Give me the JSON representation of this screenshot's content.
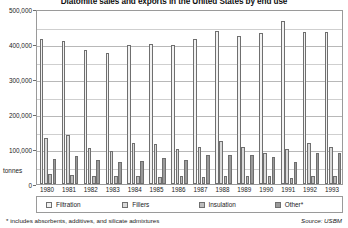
{
  "chart_data": {
    "type": "bar",
    "title": "Diatomite sales and exports in the United States by end use",
    "xlabel": "",
    "ylabel": "tonnes",
    "ylim": [
      0,
      500000
    ],
    "ytick_labels": [
      "0",
      "100,000",
      "200,000",
      "300,000",
      "400,000",
      "500,000"
    ],
    "yticks": [
      0,
      100000,
      200000,
      300000,
      400000,
      500000
    ],
    "grid": true,
    "legend_position": "bottom",
    "categories": [
      "1980",
      "1981",
      "1982",
      "1983",
      "1984",
      "1985",
      "1986",
      "1987",
      "1988",
      "1989",
      "1990",
      "1991",
      "1992",
      "1993"
    ],
    "series": [
      {
        "name": "Filtration",
        "color": "#f2f2f2",
        "values": [
          415000,
          408000,
          382000,
          373000,
          398000,
          399000,
          397000,
          413000,
          437000,
          424000,
          432000,
          465000,
          435000,
          434000
        ]
      },
      {
        "name": "Fillers",
        "color": "#d9d9d9",
        "values": [
          131000,
          140000,
          102000,
          95000,
          118000,
          114000,
          101000,
          106000,
          124000,
          107000,
          89000,
          99000,
          118000,
          106000
        ]
      },
      {
        "name": "Insulation",
        "color": "#bcbcbc",
        "values": [
          28000,
          25000,
          23000,
          22000,
          22000,
          20000,
          22000,
          20000,
          24000,
          22000,
          24000,
          18000,
          23000,
          22000
        ]
      },
      {
        "name": "Other*",
        "color": "#9a9a9a",
        "values": [
          71000,
          80000,
          68000,
          62000,
          65000,
          74000,
          70000,
          83000,
          84000,
          83000,
          76000,
          63000,
          90000,
          89000
        ]
      }
    ],
    "footnote": "* includes absorbents, additives, and silicate admixtures",
    "source": "Source: USBM"
  }
}
